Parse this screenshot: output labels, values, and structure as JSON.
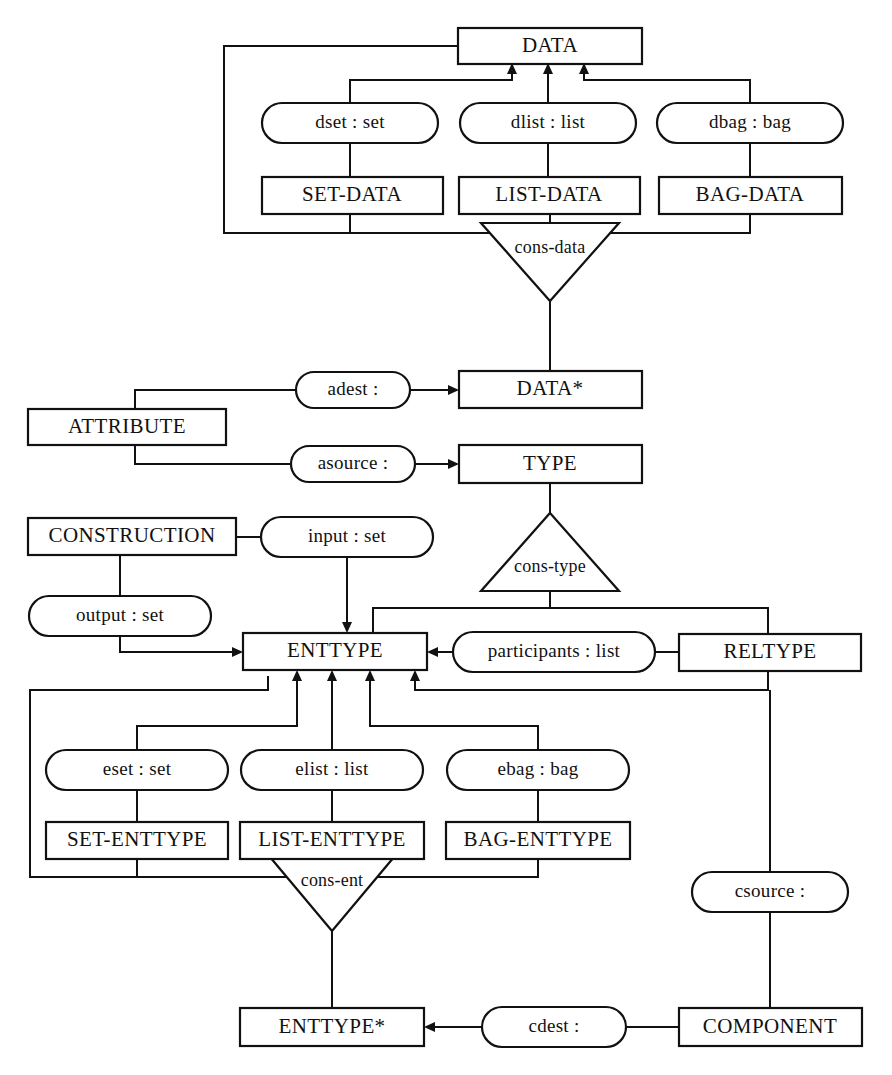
{
  "diagram": {
    "stroke_color": "#111111",
    "background_color": "#ffffff",
    "entities": [
      {
        "id": "data",
        "label": "DATA",
        "x": 458,
        "y": 28,
        "w": 184,
        "h": 36
      },
      {
        "id": "set_data",
        "label": "SET-DATA",
        "x": 262,
        "y": 177,
        "w": 181,
        "h": 37
      },
      {
        "id": "list_data",
        "label": "LIST-DATA",
        "x": 459,
        "y": 177,
        "w": 181,
        "h": 37
      },
      {
        "id": "bag_data",
        "label": "BAG-DATA",
        "x": 659,
        "y": 177,
        "w": 183,
        "h": 37
      },
      {
        "id": "data_star",
        "label": "DATA*",
        "x": 459,
        "y": 371,
        "w": 183,
        "h": 37
      },
      {
        "id": "attribute",
        "label": "ATTRIBUTE",
        "x": 28,
        "y": 409,
        "w": 198,
        "h": 36
      },
      {
        "id": "type",
        "label": "TYPE",
        "x": 459,
        "y": 445,
        "w": 183,
        "h": 38
      },
      {
        "id": "construction",
        "label": "CONSTRUCTION",
        "x": 28,
        "y": 518,
        "w": 208,
        "h": 37
      },
      {
        "id": "enttype",
        "label": "ENTTYPE",
        "x": 243,
        "y": 633,
        "w": 184,
        "h": 37
      },
      {
        "id": "reltype",
        "label": "RELTYPE",
        "x": 679,
        "y": 634,
        "w": 182,
        "h": 37
      },
      {
        "id": "set_enttype",
        "label": "SET-ENTTYPE",
        "x": 46,
        "y": 822,
        "w": 182,
        "h": 37
      },
      {
        "id": "list_enttype",
        "label": "LIST-ENTTYPE",
        "x": 240,
        "y": 822,
        "w": 184,
        "h": 37
      },
      {
        "id": "bag_enttype",
        "label": "BAG-ENTTYPE",
        "x": 446,
        "y": 822,
        "w": 184,
        "h": 37
      },
      {
        "id": "enttype_star",
        "label": "ENTTYPE*",
        "x": 240,
        "y": 1008,
        "w": 184,
        "h": 38
      },
      {
        "id": "component",
        "label": "COMPONENT",
        "x": 679,
        "y": 1008,
        "w": 183,
        "h": 38
      }
    ],
    "relationships": [
      {
        "id": "dset",
        "label": "dset : set",
        "cx": 350,
        "cy": 123,
        "rx": 88,
        "ry": 20
      },
      {
        "id": "dlist",
        "label": "dlist : list",
        "cx": 548,
        "cy": 123,
        "rx": 88,
        "ry": 20
      },
      {
        "id": "dbag",
        "label": "dbag : bag",
        "cx": 750,
        "cy": 123,
        "rx": 93,
        "ry": 20
      },
      {
        "id": "adest",
        "label": "adest :",
        "cx": 353,
        "cy": 390,
        "rx": 57,
        "ry": 18
      },
      {
        "id": "asource",
        "label": "asource :",
        "cx": 353,
        "cy": 464,
        "rx": 62,
        "ry": 18
      },
      {
        "id": "input",
        "label": "input : set",
        "cx": 347,
        "cy": 537,
        "rx": 86,
        "ry": 20
      },
      {
        "id": "output",
        "label": "output : set",
        "cx": 120,
        "cy": 616,
        "rx": 91,
        "ry": 20
      },
      {
        "id": "participants",
        "label": "participants : list",
        "cx": 554,
        "cy": 652,
        "rx": 101,
        "ry": 20
      },
      {
        "id": "eset",
        "label": "eset : set",
        "cx": 137,
        "cy": 770,
        "rx": 91,
        "ry": 20
      },
      {
        "id": "elist",
        "label": "elist : list",
        "cx": 332,
        "cy": 770,
        "rx": 91,
        "ry": 20
      },
      {
        "id": "ebag",
        "label": "ebag : bag",
        "cx": 538,
        "cy": 770,
        "rx": 91,
        "ry": 20
      },
      {
        "id": "csource",
        "label": "csource :",
        "cx": 770,
        "cy": 892,
        "rx": 78,
        "ry": 20
      },
      {
        "id": "cdest",
        "label": "cdest :",
        "cx": 554,
        "cy": 1027,
        "rx": 72,
        "ry": 20
      }
    ],
    "constructors": [
      {
        "id": "cons_data",
        "label": "cons-data",
        "cx": 550,
        "cy": 262,
        "half_w": 69,
        "h": 78,
        "orientation": "down"
      },
      {
        "id": "cons_type",
        "label": "cons-type",
        "cx": 550,
        "cy": 513,
        "half_w": 69,
        "h": 78,
        "orientation": "up"
      },
      {
        "id": "cons_ent",
        "label": "cons-ent",
        "cx": 332,
        "cy": 893,
        "half_w": 62,
        "h": 76,
        "orientation": "down"
      }
    ],
    "edge_legend": {
      "plain": "participation link",
      "arrow": "directed role link"
    }
  }
}
